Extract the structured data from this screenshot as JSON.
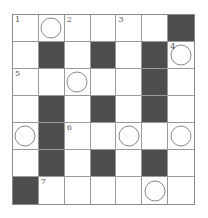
{
  "puzzle": {
    "rows": 7,
    "cols": 7,
    "colors": {
      "black": "#4d4d4d",
      "white": "#ffffff",
      "line": "#9a9a9a"
    },
    "cells": [
      [
        {
          "b": 0,
          "n": "1"
        },
        {
          "b": 0,
          "c": 1
        },
        {
          "b": 0,
          "n": "2"
        },
        {
          "b": 0
        },
        {
          "b": 0,
          "n": "3"
        },
        {
          "b": 0
        },
        {
          "b": 1
        }
      ],
      [
        {
          "b": 0
        },
        {
          "b": 1
        },
        {
          "b": 0
        },
        {
          "b": 1
        },
        {
          "b": 0
        },
        {
          "b": 1
        },
        {
          "b": 0,
          "n": "4",
          "c": 1
        }
      ],
      [
        {
          "b": 0,
          "n": "5"
        },
        {
          "b": 0
        },
        {
          "b": 0,
          "c": 1
        },
        {
          "b": 0
        },
        {
          "b": 0
        },
        {
          "b": 1
        },
        {
          "b": 0
        }
      ],
      [
        {
          "b": 0
        },
        {
          "b": 1
        },
        {
          "b": 0
        },
        {
          "b": 1
        },
        {
          "b": 0
        },
        {
          "b": 1
        },
        {
          "b": 0
        }
      ],
      [
        {
          "b": 0,
          "c": 1
        },
        {
          "b": 1
        },
        {
          "b": 0,
          "n": "6"
        },
        {
          "b": 0
        },
        {
          "b": 0,
          "c": 1
        },
        {
          "b": 0
        },
        {
          "b": 0,
          "c": 1
        }
      ],
      [
        {
          "b": 0
        },
        {
          "b": 1
        },
        {
          "b": 0
        },
        {
          "b": 1
        },
        {
          "b": 0
        },
        {
          "b": 1
        },
        {
          "b": 0
        }
      ],
      [
        {
          "b": 1
        },
        {
          "b": 0,
          "n": "7"
        },
        {
          "b": 0
        },
        {
          "b": 0
        },
        {
          "b": 0
        },
        {
          "b": 0,
          "c": 1
        },
        {
          "b": 0
        }
      ]
    ]
  }
}
